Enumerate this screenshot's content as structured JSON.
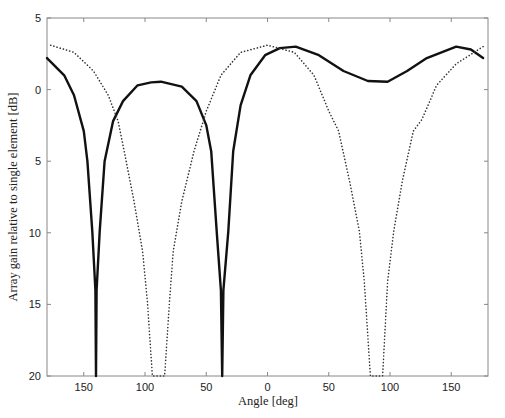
{
  "chart_data": {
    "type": "line",
    "title": "",
    "xlabel": "Angle [deg]",
    "ylabel": "Array gain relative to single element [dB]",
    "xlim": [
      180,
      -180
    ],
    "ylim": [
      -20,
      5
    ],
    "grid": false,
    "legend": null,
    "x_ticks": [
      150,
      100,
      50,
      0,
      -50,
      -100,
      -150
    ],
    "x_tick_labels": [
      "150",
      "100",
      "50",
      "0",
      "50",
      "100",
      "150"
    ],
    "y_ticks": [
      5,
      0,
      -5,
      -10,
      -15,
      -20
    ],
    "y_tick_labels": [
      "5",
      "0",
      "5",
      "10",
      "15",
      "20"
    ],
    "series": [
      {
        "name": "solid",
        "style": "solid",
        "color": "#111111",
        "width": 2.4,
        "points": [
          [
            180,
            2.2
          ],
          [
            166,
            1.0
          ],
          [
            158,
            -0.4
          ],
          [
            150,
            -2.9
          ],
          [
            147,
            -5.0
          ],
          [
            143,
            -9.9
          ],
          [
            140.5,
            -14
          ],
          [
            140,
            -20
          ],
          [
            139.5,
            -14
          ],
          [
            137,
            -9.9
          ],
          [
            133,
            -5.0
          ],
          [
            126,
            -2.2
          ],
          [
            118,
            -0.8
          ],
          [
            106,
            0.3
          ],
          [
            95,
            0.5
          ],
          [
            87,
            0.55
          ],
          [
            70,
            0.2
          ],
          [
            58,
            -0.8
          ],
          [
            50,
            -2.5
          ],
          [
            46,
            -4.3
          ],
          [
            41.5,
            -9.9
          ],
          [
            38,
            -14
          ],
          [
            37,
            -20
          ],
          [
            36,
            -14
          ],
          [
            32,
            -9.9
          ],
          [
            28,
            -4.3
          ],
          [
            22,
            -1.1
          ],
          [
            14,
            1.0
          ],
          [
            2,
            2.4
          ],
          [
            -10,
            2.9
          ],
          [
            -23,
            3.0
          ],
          [
            -42,
            2.4
          ],
          [
            -62,
            1.3
          ],
          [
            -82,
            0.6
          ],
          [
            -98,
            0.55
          ],
          [
            -114,
            1.3
          ],
          [
            -130,
            2.2
          ],
          [
            -154,
            3.0
          ],
          [
            -166,
            2.8
          ],
          [
            -176,
            2.2
          ]
        ]
      },
      {
        "name": "dotted",
        "style": "dotted",
        "color": "#333333",
        "width": 1.6,
        "points": [
          [
            177,
            3.1
          ],
          [
            158,
            2.6
          ],
          [
            142,
            1.3
          ],
          [
            130,
            -0.4
          ],
          [
            122,
            -2.2
          ],
          [
            117,
            -4.3
          ],
          [
            109,
            -7.8
          ],
          [
            102,
            -11.3
          ],
          [
            98,
            -14.8
          ],
          [
            94,
            -20
          ],
          [
            89.5,
            -20
          ],
          [
            84,
            -20
          ],
          [
            80,
            -14.8
          ],
          [
            77,
            -11.3
          ],
          [
            70,
            -7.8
          ],
          [
            60,
            -4.3
          ],
          [
            50,
            -1.5
          ],
          [
            38,
            1.0
          ],
          [
            22,
            2.6
          ],
          [
            0,
            3.1
          ],
          [
            -22,
            2.6
          ],
          [
            -38,
            1.0
          ],
          [
            -50,
            -1.5
          ],
          [
            -58,
            -2.9
          ],
          [
            -67,
            -6.4
          ],
          [
            -75,
            -9.9
          ],
          [
            -79,
            -13.4
          ],
          [
            -84,
            -20
          ],
          [
            -89.5,
            -20
          ],
          [
            -94,
            -20
          ],
          [
            -98,
            -13.4
          ],
          [
            -103,
            -9.9
          ],
          [
            -110,
            -6.4
          ],
          [
            -119,
            -2.9
          ],
          [
            -126,
            -2.1
          ],
          [
            -138,
            0.3
          ],
          [
            -154,
            1.8
          ],
          [
            -176,
            3.0
          ]
        ]
      }
    ],
    "plot_box": {
      "left": 47,
      "top": 18,
      "right": 488,
      "bottom": 376
    }
  }
}
